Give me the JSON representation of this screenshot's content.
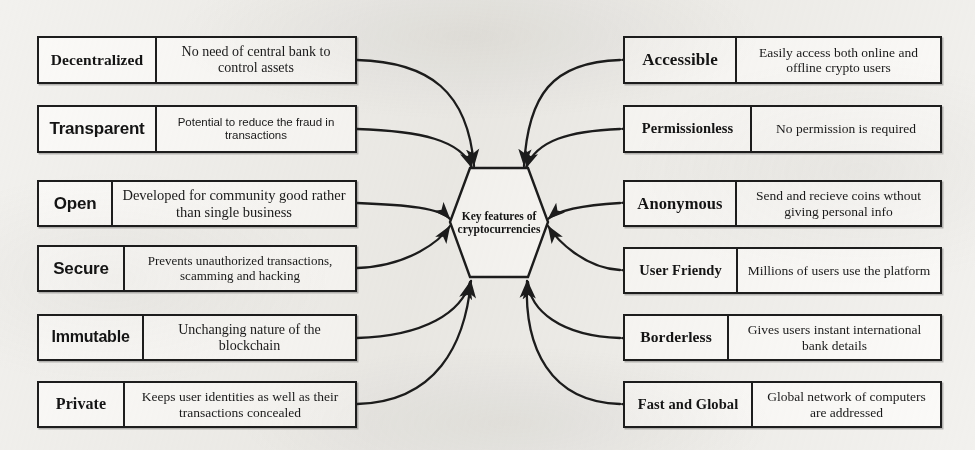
{
  "diagram": {
    "title_text": "Key features of cryptocurrencies",
    "hub": {
      "label": "Key features of cryptocurrencies",
      "shape": "hexagon"
    },
    "colors": {
      "background": "#f2f1ee",
      "box_fill": "#fbfaf8",
      "stroke": "#1d1d1d",
      "text": "#141414"
    },
    "left_features": [
      {
        "label": "Decentralized",
        "description": "No need of central bank to control assets"
      },
      {
        "label": "Transparent",
        "description": "Potential to reduce the fraud in transactions"
      },
      {
        "label": "Open",
        "description": "Developed for community good rather than single business"
      },
      {
        "label": "Secure",
        "description": "Prevents unauthorized transactions, scamming and hacking"
      },
      {
        "label": "Immutable",
        "description": "Unchanging nature of the blockchain"
      },
      {
        "label": "Private",
        "description": "Keeps user identities as well as their transactions concealed"
      }
    ],
    "right_features": [
      {
        "label": "Accessible",
        "description": "Easily access both online and offline crypto users"
      },
      {
        "label": "Permissionless",
        "description": "No permission is required"
      },
      {
        "label": "Anonymous",
        "description": "Send and recieve coins wthout giving personal info"
      },
      {
        "label": "User Friendy",
        "description": "Millions of users use the platform"
      },
      {
        "label": "Borderless",
        "description": "Gives users instant international bank details"
      },
      {
        "label": "Fast and Global",
        "description": "Global network of computers are addressed"
      }
    ]
  }
}
